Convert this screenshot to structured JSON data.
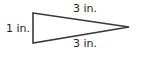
{
  "diagram": {
    "shape": "triangle",
    "stroke_color": "#3a3a3a",
    "labels": {
      "top_side": "3 in.",
      "left_side": "1 in.",
      "bottom_side": "3 in."
    }
  }
}
